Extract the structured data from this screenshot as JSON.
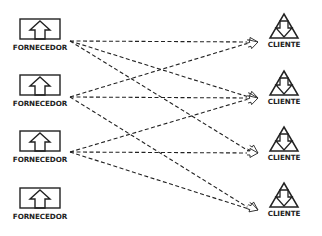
{
  "diagram": {
    "type": "supplier-client network",
    "suppliers": [
      {
        "label": "FORNECEDOR",
        "icon": "box-up-arrow-icon",
        "x": 14,
        "y": 14,
        "port": [
          70,
          41
        ]
      },
      {
        "label": "FORNECEDOR",
        "icon": "box-up-arrow-icon",
        "x": 14,
        "y": 70,
        "port": [
          70,
          97
        ]
      },
      {
        "label": "FORNECEDOR",
        "icon": "box-up-arrow-icon",
        "x": 14,
        "y": 126,
        "port": [
          70,
          152
        ]
      },
      {
        "label": "FORNECEDOR",
        "icon": "box-up-arrow-icon",
        "x": 14,
        "y": 183,
        "port": null
      }
    ],
    "clients": [
      {
        "label": "CLIENTE",
        "icon": "triangle-down-arrow-icon",
        "x": 270,
        "y": 14,
        "port": [
          258,
          42
        ]
      },
      {
        "label": "CLIENTE",
        "icon": "triangle-down-arrow-icon",
        "x": 270,
        "y": 71,
        "port": [
          258,
          98
        ]
      },
      {
        "label": "CLIENTE",
        "icon": "triangle-down-arrow-icon",
        "x": 270,
        "y": 127,
        "port": [
          258,
          153
        ]
      },
      {
        "label": "CLIENTE",
        "icon": "triangle-down-arrow-icon",
        "x": 270,
        "y": 183,
        "port": [
          258,
          210
        ]
      }
    ],
    "connections": [
      {
        "from": 0,
        "to": 0
      },
      {
        "from": 0,
        "to": 1
      },
      {
        "from": 0,
        "to": 2
      },
      {
        "from": 1,
        "to": 0
      },
      {
        "from": 1,
        "to": 1
      },
      {
        "from": 1,
        "to": 3
      },
      {
        "from": 2,
        "to": 1
      },
      {
        "from": 2,
        "to": 2
      },
      {
        "from": 2,
        "to": 3
      }
    ],
    "colors": {
      "stroke": "#222222",
      "background": "#ffffff"
    }
  }
}
